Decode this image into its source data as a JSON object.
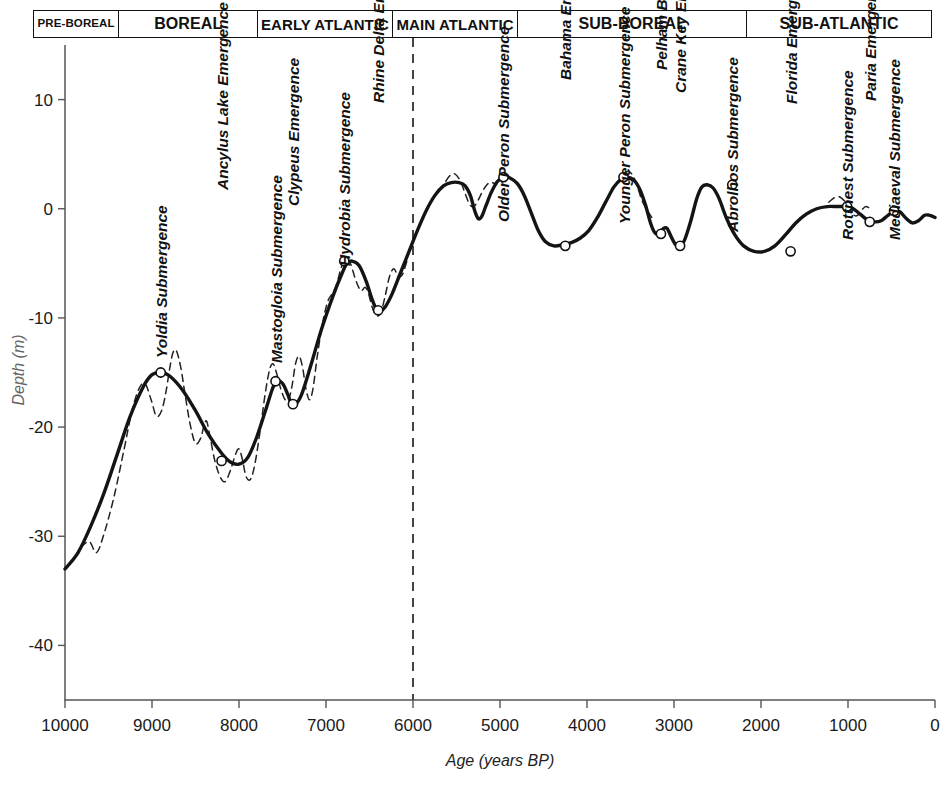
{
  "figure": {
    "periods": [
      {
        "name": "PRE-BOREAL",
        "x_start": 10000,
        "x_end": 9050,
        "font_size": 11.5
      },
      {
        "name": "BOREAL",
        "x_start": 9050,
        "x_end": 7500,
        "font_size": 16
      },
      {
        "name": "EARLY ATLANTIC",
        "x_start": 7500,
        "x_end": 6000,
        "font_size": 15
      },
      {
        "name": "MAIN ATLANTIC",
        "x_start": 6000,
        "x_end": 4600,
        "font_size": 15
      },
      {
        "name": "SUB-BOREAL",
        "x_start": 4600,
        "x_end": 2050,
        "font_size": 16
      },
      {
        "name": "SUB-ATLANTIC",
        "x_start": 2050,
        "x_end": 0,
        "font_size": 16
      }
    ]
  },
  "chart_data": {
    "type": "line",
    "title": "",
    "xlabel": "Age (years BP)",
    "ylabel": "Depth (m)",
    "xlim": [
      10000,
      0
    ],
    "ylim": [
      -45,
      15
    ],
    "x_ticks": [
      10000,
      9000,
      8000,
      7000,
      6000,
      5000,
      4000,
      3000,
      2000,
      1000,
      0
    ],
    "y_ticks": [
      10,
      0,
      -10,
      -20,
      -30,
      -40
    ],
    "grid": false,
    "legend": "none",
    "x_reverse": true,
    "reference_line": {
      "x": 6000,
      "style": "dashed",
      "label": ""
    },
    "series": [
      {
        "name": "Eustatic sea level curve (smoothed)",
        "style": "solid",
        "points": [
          [
            10000,
            -33.0
          ],
          [
            9850,
            -31.5
          ],
          [
            9700,
            -29.0
          ],
          [
            9550,
            -26.0
          ],
          [
            9400,
            -22.5
          ],
          [
            9250,
            -19.0
          ],
          [
            9100,
            -16.3
          ],
          [
            9000,
            -15.2
          ],
          [
            8900,
            -15.0
          ],
          [
            8800,
            -15.3
          ],
          [
            8650,
            -16.6
          ],
          [
            8500,
            -18.5
          ],
          [
            8350,
            -20.7
          ],
          [
            8200,
            -22.4
          ],
          [
            8100,
            -23.2
          ],
          [
            8000,
            -23.4
          ],
          [
            7900,
            -22.8
          ],
          [
            7800,
            -21.0
          ],
          [
            7700,
            -18.6
          ],
          [
            7620,
            -16.6
          ],
          [
            7570,
            -15.8
          ],
          [
            7500,
            -16.0
          ],
          [
            7440,
            -17.0
          ],
          [
            7400,
            -17.8
          ],
          [
            7350,
            -17.9
          ],
          [
            7280,
            -17.0
          ],
          [
            7180,
            -14.5
          ],
          [
            7050,
            -11.0
          ],
          [
            6920,
            -8.0
          ],
          [
            6820,
            -6.0
          ],
          [
            6760,
            -5.0
          ],
          [
            6700,
            -4.8
          ],
          [
            6620,
            -5.2
          ],
          [
            6540,
            -6.6
          ],
          [
            6470,
            -8.3
          ],
          [
            6420,
            -9.2
          ],
          [
            6380,
            -9.4
          ],
          [
            6320,
            -9.0
          ],
          [
            6240,
            -7.8
          ],
          [
            6150,
            -6.0
          ],
          [
            6050,
            -4.0
          ],
          [
            5950,
            -2.0
          ],
          [
            5850,
            -0.2
          ],
          [
            5750,
            1.2
          ],
          [
            5650,
            2.1
          ],
          [
            5560,
            2.4
          ],
          [
            5470,
            2.4
          ],
          [
            5400,
            2.1
          ],
          [
            5340,
            1.2
          ],
          [
            5290,
            -0.2
          ],
          [
            5250,
            -0.9
          ],
          [
            5210,
            -0.7
          ],
          [
            5160,
            0.3
          ],
          [
            5100,
            1.5
          ],
          [
            5030,
            2.5
          ],
          [
            4960,
            2.9
          ],
          [
            4880,
            2.8
          ],
          [
            4800,
            2.3
          ],
          [
            4720,
            1.2
          ],
          [
            4640,
            -0.4
          ],
          [
            4560,
            -2.0
          ],
          [
            4480,
            -3.0
          ],
          [
            4380,
            -3.4
          ],
          [
            4280,
            -3.3
          ],
          [
            4180,
            -3.1
          ],
          [
            4080,
            -2.7
          ],
          [
            3980,
            -2.0
          ],
          [
            3880,
            -0.8
          ],
          [
            3780,
            0.7
          ],
          [
            3690,
            2.0
          ],
          [
            3610,
            2.7
          ],
          [
            3540,
            2.9
          ],
          [
            3470,
            2.7
          ],
          [
            3400,
            1.9
          ],
          [
            3330,
            0.4
          ],
          [
            3270,
            -1.3
          ],
          [
            3220,
            -2.2
          ],
          [
            3170,
            -2.3
          ],
          [
            3120,
            -1.8
          ],
          [
            3080,
            -1.8
          ],
          [
            3030,
            -2.6
          ],
          [
            2980,
            -3.3
          ],
          [
            2930,
            -3.4
          ],
          [
            2880,
            -2.9
          ],
          [
            2810,
            -1.2
          ],
          [
            2740,
            0.9
          ],
          [
            2680,
            2.0
          ],
          [
            2620,
            2.2
          ],
          [
            2550,
            1.9
          ],
          [
            2480,
            0.9
          ],
          [
            2400,
            -0.8
          ],
          [
            2300,
            -2.4
          ],
          [
            2200,
            -3.4
          ],
          [
            2080,
            -3.9
          ],
          [
            1960,
            -3.9
          ],
          [
            1840,
            -3.4
          ],
          [
            1720,
            -2.4
          ],
          [
            1600,
            -1.3
          ],
          [
            1480,
            -0.5
          ],
          [
            1360,
            0.0
          ],
          [
            1240,
            0.2
          ],
          [
            1120,
            0.2
          ],
          [
            1020,
            0.2
          ],
          [
            940,
            0.0
          ],
          [
            860,
            -0.5
          ],
          [
            780,
            -1.0
          ],
          [
            700,
            -1.2
          ],
          [
            620,
            -1.1
          ],
          [
            540,
            -0.6
          ],
          [
            460,
            -0.2
          ],
          [
            400,
            -0.3
          ],
          [
            330,
            -0.9
          ],
          [
            260,
            -1.3
          ],
          [
            190,
            -1.1
          ],
          [
            120,
            -0.6
          ],
          [
            60,
            -0.6
          ],
          [
            0,
            -0.8
          ]
        ]
      },
      {
        "name": "Eustatic sea level curve (detailed oscillations)",
        "style": "dashed",
        "points": [
          [
            9820,
            -31.0
          ],
          [
            9720,
            -30.5
          ],
          [
            9640,
            -31.5
          ],
          [
            9560,
            -30.0
          ],
          [
            9440,
            -26.5
          ],
          [
            9320,
            -22.0
          ],
          [
            9230,
            -18.5
          ],
          [
            9150,
            -16.5
          ],
          [
            9080,
            -16.0
          ],
          [
            9010,
            -17.5
          ],
          [
            8950,
            -19.0
          ],
          [
            8890,
            -18.5
          ],
          [
            8840,
            -16.8
          ],
          [
            8800,
            -14.8
          ],
          [
            8760,
            -13.2
          ],
          [
            8720,
            -13.0
          ],
          [
            8670,
            -14.5
          ],
          [
            8620,
            -17.0
          ],
          [
            8560,
            -19.8
          ],
          [
            8500,
            -21.5
          ],
          [
            8440,
            -21.0
          ],
          [
            8400,
            -19.8
          ],
          [
            8370,
            -19.5
          ],
          [
            8330,
            -21.0
          ],
          [
            8280,
            -23.0
          ],
          [
            8220,
            -24.5
          ],
          [
            8160,
            -25.0
          ],
          [
            8100,
            -24.0
          ],
          [
            8040,
            -22.5
          ],
          [
            8000,
            -22.0
          ],
          [
            7960,
            -23.0
          ],
          [
            7920,
            -24.5
          ],
          [
            7870,
            -24.8
          ],
          [
            7820,
            -23.5
          ],
          [
            7760,
            -20.5
          ],
          [
            7700,
            -17.0
          ],
          [
            7650,
            -14.8
          ],
          [
            7610,
            -14.2
          ],
          [
            7570,
            -15.0
          ],
          [
            7520,
            -16.5
          ],
          [
            7470,
            -17.5
          ],
          [
            7430,
            -17.5
          ],
          [
            7390,
            -16.2
          ],
          [
            7350,
            -14.2
          ],
          [
            7310,
            -13.5
          ],
          [
            7270,
            -14.5
          ],
          [
            7230,
            -16.5
          ],
          [
            7190,
            -17.5
          ],
          [
            7150,
            -16.5
          ],
          [
            7100,
            -13.5
          ],
          [
            7040,
            -10.5
          ],
          [
            6980,
            -8.5
          ],
          [
            6930,
            -7.8
          ],
          [
            6880,
            -7.0
          ],
          [
            6830,
            -5.5
          ],
          [
            6780,
            -4.6
          ],
          [
            6720,
            -5.0
          ],
          [
            6660,
            -6.5
          ],
          [
            6600,
            -7.5
          ],
          [
            6550,
            -7.2
          ],
          [
            6510,
            -7.8
          ],
          [
            6470,
            -9.0
          ],
          [
            6420,
            -9.8
          ],
          [
            6370,
            -9.5
          ],
          [
            6320,
            -8.0
          ],
          [
            6270,
            -6.2
          ],
          [
            6220,
            -5.5
          ],
          [
            6170,
            -6.2
          ],
          [
            6120,
            -6.0
          ],
          [
            6060,
            -4.5
          ],
          [
            5700,
            1.6
          ],
          [
            5640,
            2.3
          ],
          [
            5580,
            3.0
          ],
          [
            5520,
            3.2
          ],
          [
            5460,
            2.6
          ],
          [
            5400,
            1.4
          ],
          [
            5350,
            0.4
          ],
          [
            5300,
            0.2
          ],
          [
            5250,
            0.8
          ],
          [
            5200,
            1.6
          ],
          [
            5150,
            2.2
          ],
          [
            5100,
            2.4
          ],
          [
            5040,
            2.2
          ],
          [
            3640,
            2.5
          ],
          [
            3580,
            3.2
          ],
          [
            3520,
            3.4
          ],
          [
            3470,
            3.0
          ],
          [
            3420,
            2.0
          ],
          [
            3370,
            0.8
          ],
          [
            3320,
            0.0
          ],
          [
            3280,
            -0.5
          ],
          [
            3240,
            -1.0
          ],
          [
            1220,
            0.6
          ],
          [
            1160,
            1.0
          ],
          [
            1100,
            1.1
          ],
          [
            1040,
            0.7
          ],
          [
            980,
            0.0
          ],
          [
            930,
            -0.6
          ],
          [
            890,
            -0.6
          ],
          [
            850,
            -0.2
          ],
          [
            800,
            0.2
          ],
          [
            760,
            0.1
          ]
        ]
      }
    ],
    "annotations": [
      {
        "label": "Yoldia Submergence",
        "x": 8900,
        "y": -15.0,
        "marker": true,
        "text_y_top": 358
      },
      {
        "label": "Ancylus Lake Emergence",
        "x": 8200,
        "y": -23.1,
        "marker": true,
        "text_y_top": 190
      },
      {
        "label": "Mastogloia Submergence",
        "x": 7580,
        "y": -15.8,
        "marker": true,
        "text_y_top": 363
      },
      {
        "label": "Clypeus Emergence",
        "x": 7380,
        "y": -17.9,
        "marker": true,
        "text_y_top": 206
      },
      {
        "label": "Hydrobia Submergence",
        "x": 6790,
        "y": -4.8,
        "marker": true,
        "text_y_top": 266
      },
      {
        "label": "Rhine Delta Emergence",
        "x": 6400,
        "y": -9.3,
        "marker": true,
        "text_y_top": 103
      },
      {
        "label": "Older Peron Submergence",
        "x": 4960,
        "y": 2.9,
        "marker": true,
        "text_y_top": 222
      },
      {
        "label": "Bahama Emergence",
        "x": 4250,
        "y": -3.4,
        "marker": true,
        "text_y_top": 80
      },
      {
        "label": "Younger Peron Submergence",
        "x": 3580,
        "y": 2.9,
        "marker": true,
        "text_y_top": 224
      },
      {
        "label": "Pelham Bay Emergence",
        "x": 3150,
        "y": -2.3,
        "marker": true,
        "text_y_top": 70
      },
      {
        "label": "Crane Key Emergence",
        "x": 2930,
        "y": -3.4,
        "marker": true,
        "text_y_top": 93
      },
      {
        "label": "Abrolhos Submergence",
        "x": 2330,
        "y": 2.2,
        "marker": true,
        "text_y_top": 232
      },
      {
        "label": "Florida Emergence",
        "x": 1660,
        "y": -3.9,
        "marker": true,
        "text_y_top": 104
      },
      {
        "label": "Rottnest Submergence",
        "x": 1010,
        "y": 0.2,
        "marker": true,
        "text_y_top": 240
      },
      {
        "label": "Paria Emergence",
        "x": 750,
        "y": -1.2,
        "marker": true,
        "text_y_top": 101
      },
      {
        "label": "Mediaeval Submergence",
        "x": 470,
        "y": -0.2,
        "marker": true,
        "text_y_top": 240
      }
    ]
  }
}
